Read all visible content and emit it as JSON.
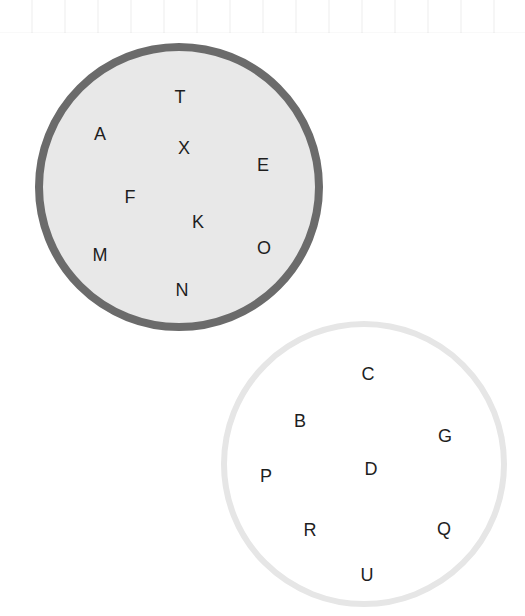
{
  "sets": [
    {
      "id": "set-a",
      "fill": "#e8e8e8",
      "border": "#6b6b6b",
      "elements": [
        {
          "label": "T",
          "x": 180,
          "y": 97
        },
        {
          "label": "A",
          "x": 100,
          "y": 134
        },
        {
          "label": "X",
          "x": 184,
          "y": 148
        },
        {
          "label": "E",
          "x": 263,
          "y": 165
        },
        {
          "label": "F",
          "x": 130,
          "y": 197
        },
        {
          "label": "K",
          "x": 198,
          "y": 222
        },
        {
          "label": "O",
          "x": 264,
          "y": 248
        },
        {
          "label": "M",
          "x": 100,
          "y": 255
        },
        {
          "label": "N",
          "x": 182,
          "y": 290
        }
      ]
    },
    {
      "id": "set-b",
      "fill": "#ffffff",
      "border": "#e6e6e6",
      "elements": [
        {
          "label": "C",
          "x": 368,
          "y": 374
        },
        {
          "label": "B",
          "x": 300,
          "y": 421
        },
        {
          "label": "G",
          "x": 445,
          "y": 436
        },
        {
          "label": "D",
          "x": 371,
          "y": 469
        },
        {
          "label": "P",
          "x": 266,
          "y": 476
        },
        {
          "label": "R",
          "x": 310,
          "y": 530
        },
        {
          "label": "Q",
          "x": 444,
          "y": 529
        },
        {
          "label": "U",
          "x": 367,
          "y": 575
        }
      ]
    }
  ]
}
